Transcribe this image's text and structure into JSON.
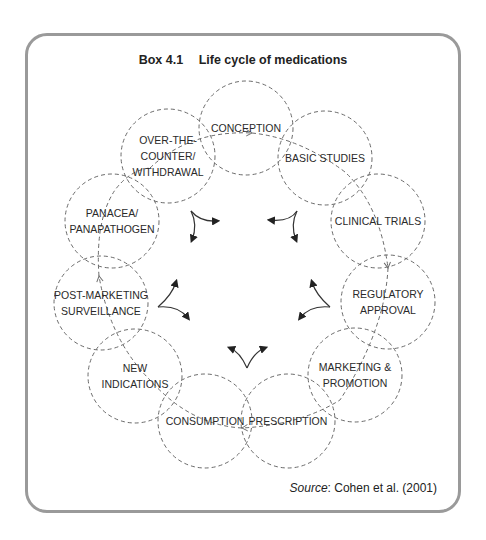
{
  "box": {
    "number": "Box 4.1",
    "title": "Life cycle of medications",
    "source_label": "Source",
    "source_text": ": Cohen et al. (2001)"
  },
  "nodes": [
    {
      "id": "conception",
      "lines": [
        "CONCEPTION"
      ],
      "cx": 246,
      "cy": 128
    },
    {
      "id": "basic-studies",
      "lines": [
        "BASIC STUDIES"
      ],
      "cx": 325,
      "cy": 158
    },
    {
      "id": "clinical-trials",
      "lines": [
        "CLINICAL TRIALS"
      ],
      "cx": 378,
      "cy": 221
    },
    {
      "id": "regulatory-approval",
      "lines": [
        "REGULATORY",
        "APPROVAL"
      ],
      "cx": 388,
      "cy": 302
    },
    {
      "id": "marketing-promotion",
      "lines": [
        "MARKETING &",
        "PROMOTION"
      ],
      "cx": 355,
      "cy": 375
    },
    {
      "id": "prescription",
      "lines": [
        "PRESCRIPTION"
      ],
      "cx": 288,
      "cy": 421
    },
    {
      "id": "consumption",
      "lines": [
        "CONSUMPTION"
      ],
      "cx": 205,
      "cy": 421
    },
    {
      "id": "new-indications",
      "lines": [
        "NEW",
        "INDICATIONS"
      ],
      "cx": 135,
      "cy": 376
    },
    {
      "id": "post-marketing-surveillance",
      "lines": [
        "POST-MARKETING",
        "SURVEILLANCE"
      ],
      "cx": 101,
      "cy": 303
    },
    {
      "id": "panacea-panapathogen",
      "lines": [
        "PANACEA/",
        "PANAPATHOGEN"
      ],
      "cx": 112,
      "cy": 221
    },
    {
      "id": "over-the-counter-withdrawal",
      "lines": [
        "OVER-THE-",
        "COUNTER/",
        "WITHDRAWAL"
      ],
      "cx": 168,
      "cy": 156
    }
  ],
  "style": {
    "circle_radius": 47,
    "dash_color": "#6a6a6a",
    "arrow_color": "#222222",
    "border_color": "#9a9a9a"
  }
}
